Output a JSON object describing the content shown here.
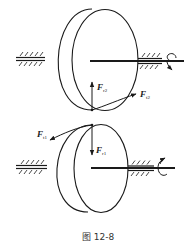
{
  "figure": {
    "caption": "图 12-8",
    "colors": {
      "line": "#1a1a1a",
      "background": "#ffffff",
      "caption": "#333333"
    }
  },
  "gear_top": {
    "name": "driven gear (gear 2)",
    "forces": [
      {
        "symbol": "F",
        "subscript": "r2",
        "direction": "up"
      },
      {
        "symbol": "F",
        "subscript": "t2",
        "direction": "tangent-right"
      }
    ],
    "rotation_indicator": "rotation-arrow-right-end"
  },
  "gear_bottom": {
    "name": "driving gear (gear 1)",
    "forces": [
      {
        "symbol": "F",
        "subscript": "t1",
        "direction": "tangent-left"
      },
      {
        "symbol": "F",
        "subscript": "r1",
        "direction": "down"
      }
    ],
    "rotation_indicator": "rotation-arrow-right-end"
  }
}
